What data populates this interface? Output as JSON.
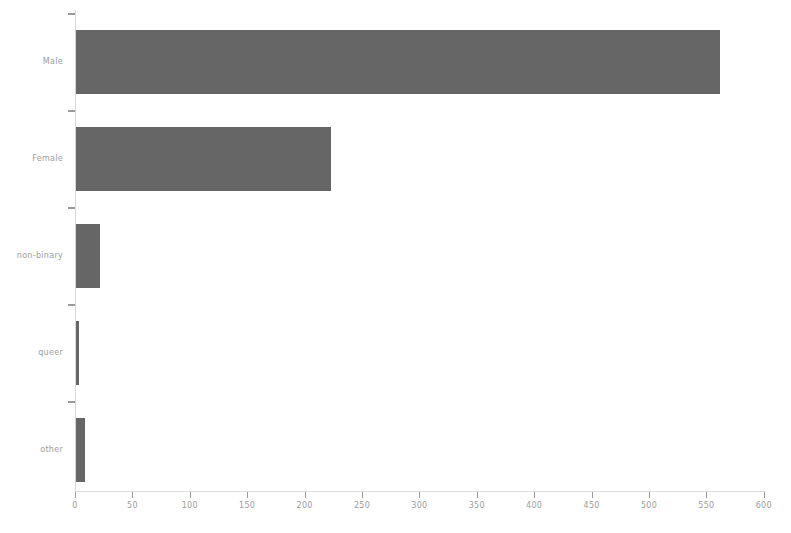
{
  "chart_data": {
    "type": "bar",
    "orientation": "horizontal",
    "title": "",
    "subtitle": "",
    "xlabel": "",
    "ylabel": "",
    "categories": [
      "Male",
      "Female",
      "non-binary",
      "queer",
      "other"
    ],
    "values": [
      561,
      222,
      21,
      3,
      8
    ],
    "series": [
      {
        "name": "count",
        "values": [
          561,
          222,
          21,
          3,
          8
        ]
      }
    ],
    "xlim": [
      0,
      618
    ],
    "xticks": [
      0,
      50,
      100,
      150,
      200,
      250,
      300,
      350,
      400,
      450,
      500,
      550,
      600
    ],
    "xtick_labels": [
      "0",
      "50",
      "100",
      "150",
      "200",
      "250",
      "300",
      "350",
      "400",
      "450",
      "500",
      "550",
      "600"
    ],
    "grid": false,
    "legend": false,
    "legend_position": "none",
    "annotations": [],
    "colors": {
      "bar_fill": "#4d4d4d",
      "axis_line": "#dcdcdc",
      "tick_mark": "#9a9a9a",
      "tick_label": "#9d9d9d",
      "background": "#ffffff"
    }
  }
}
